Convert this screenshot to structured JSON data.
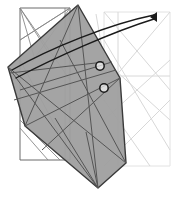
{
  "figure": {
    "width": 178,
    "height": 203,
    "background_color": "#ffffff",
    "colors": {
      "shaded_fill": "#9f9f9f",
      "shaded_stroke": "#333333",
      "mesh_dark": "#555555",
      "mesh_mid": "#888888",
      "mesh_light": "#d8d8d8",
      "mesh_faint": "#e8e8e8",
      "arrow": "#1a1a1a",
      "marker_ring": "#1a1a1a",
      "marker_fill": "#ffffff"
    }
  },
  "base_rectangle": {
    "name": "base-rectangle",
    "stroke": "#6a6a6a",
    "points": "20,8 70,8 70,160 20,160"
  },
  "right_rectangle": {
    "name": "right-faint-rectangle",
    "stroke": "#e2e2e2",
    "points": "104,12 170,12 170,166 104,166"
  },
  "shaded_polygon": {
    "name": "shaded-quadrilateral",
    "fill": "#9f9f9f",
    "stroke": "#3a3a3a",
    "opacity": 0.95,
    "points": "78,5 8,67 25,126 98,188 126,163 120,78"
  },
  "mesh_dark_lines": [
    {
      "x1": 8,
      "y1": 67,
      "x2": 126,
      "y2": 163
    },
    {
      "x1": 8,
      "y1": 67,
      "x2": 98,
      "y2": 188
    },
    {
      "x1": 78,
      "y1": 5,
      "x2": 98,
      "y2": 188
    },
    {
      "x1": 78,
      "y1": 5,
      "x2": 25,
      "y2": 126
    },
    {
      "x1": 25,
      "y1": 126,
      "x2": 120,
      "y2": 78
    },
    {
      "x1": 60,
      "y1": 40,
      "x2": 126,
      "y2": 163
    },
    {
      "x1": 20,
      "y1": 90,
      "x2": 112,
      "y2": 62
    },
    {
      "x1": 14,
      "y1": 100,
      "x2": 116,
      "y2": 70
    },
    {
      "x1": 42,
      "y1": 150,
      "x2": 120,
      "y2": 78
    },
    {
      "x1": 55,
      "y1": 118,
      "x2": 98,
      "y2": 188
    },
    {
      "x1": 86,
      "y1": 132,
      "x2": 98,
      "y2": 188
    },
    {
      "x1": 10,
      "y1": 73,
      "x2": 104,
      "y2": 62
    }
  ],
  "mesh_mid_lines": [
    {
      "x1": 20,
      "y1": 8,
      "x2": 70,
      "y2": 80
    },
    {
      "x1": 20,
      "y1": 8,
      "x2": 48,
      "y2": 52
    },
    {
      "x1": 20,
      "y1": 8,
      "x2": 35,
      "y2": 60
    },
    {
      "x1": 70,
      "y1": 8,
      "x2": 32,
      "y2": 62
    },
    {
      "x1": 70,
      "y1": 8,
      "x2": 20,
      "y2": 40
    },
    {
      "x1": 20,
      "y1": 40,
      "x2": 70,
      "y2": 8
    },
    {
      "x1": 65,
      "y1": 8,
      "x2": 65,
      "y2": 160
    },
    {
      "x1": 20,
      "y1": 120,
      "x2": 60,
      "y2": 160
    },
    {
      "x1": 20,
      "y1": 128,
      "x2": 48,
      "y2": 160
    },
    {
      "x1": 20,
      "y1": 60,
      "x2": 68,
      "y2": 150
    }
  ],
  "mesh_light_lines": [
    {
      "x1": 104,
      "y1": 12,
      "x2": 170,
      "y2": 90
    },
    {
      "x1": 104,
      "y1": 90,
      "x2": 170,
      "y2": 12
    },
    {
      "x1": 104,
      "y1": 60,
      "x2": 170,
      "y2": 120
    },
    {
      "x1": 104,
      "y1": 120,
      "x2": 170,
      "y2": 60
    },
    {
      "x1": 104,
      "y1": 76,
      "x2": 170,
      "y2": 76
    },
    {
      "x1": 118,
      "y1": 12,
      "x2": 118,
      "y2": 166
    },
    {
      "x1": 104,
      "y1": 166,
      "x2": 170,
      "y2": 100
    },
    {
      "x1": 104,
      "y1": 100,
      "x2": 150,
      "y2": 166
    },
    {
      "x1": 96,
      "y1": 14,
      "x2": 104,
      "y2": 60
    },
    {
      "x1": 104,
      "y1": 40,
      "x2": 170,
      "y2": 150
    }
  ],
  "sweep_arrow": {
    "name": "sweep-arrow",
    "stroke": "#1a1a1a",
    "width": 1.4,
    "upper_path": "M 12,70 C 50,48 110,24 154,15",
    "lower_path": "M 16,78 C 54,58 112,32 154,19",
    "head_points": "157,12 157,22 150,17"
  },
  "node_markers": [
    {
      "name": "node-marker-upper",
      "cx": 100,
      "cy": 66,
      "r": 4.2
    },
    {
      "name": "node-marker-lower",
      "cx": 104,
      "cy": 88,
      "r": 4.2
    }
  ]
}
